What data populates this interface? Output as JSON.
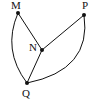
{
  "diagram": {
    "type": "graph",
    "nodes": [
      {
        "id": "M",
        "label": "M",
        "x": 18,
        "y": 13,
        "lx": 11,
        "ly": 9
      },
      {
        "id": "N",
        "label": "N",
        "x": 42,
        "y": 50,
        "lx": 29,
        "ly": 51
      },
      {
        "id": "P",
        "label": "P",
        "x": 84,
        "y": 15,
        "lx": 82,
        "ly": 9
      },
      {
        "id": "Q",
        "label": "Q",
        "x": 27,
        "y": 83,
        "lx": 22,
        "ly": 97
      }
    ],
    "edges": [
      {
        "from": "M",
        "to": "N",
        "shape": "straight"
      },
      {
        "from": "N",
        "to": "P",
        "shape": "straight"
      },
      {
        "from": "N",
        "to": "Q",
        "shape": "straight"
      },
      {
        "from": "M",
        "to": "Q",
        "shape": "curve"
      },
      {
        "from": "P",
        "to": "Q",
        "shape": "curve"
      }
    ]
  }
}
